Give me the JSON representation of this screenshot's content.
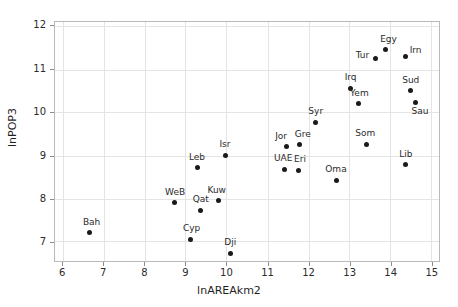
{
  "chart_data": {
    "type": "scatter",
    "title": "",
    "xlabel": "lnAREAkm2",
    "ylabel": "lnPOP3",
    "xlim": [
      5.8,
      15.2
    ],
    "ylim": [
      6.55,
      12.1
    ],
    "xticks": [
      6,
      7,
      8,
      9,
      10,
      11,
      12,
      13,
      14,
      15
    ],
    "yticks": [
      7,
      8,
      9,
      10,
      11,
      12
    ],
    "grid": true,
    "legend": "none",
    "marker_color": "#1a1a1a",
    "grid_color": "#e4e4e4",
    "frame_color": "#b9b9b9",
    "points": [
      {
        "label": "Bah",
        "x": 6.65,
        "y": 7.25,
        "lx": -7,
        "ly": -15
      },
      {
        "label": "WeB",
        "x": 8.7,
        "y": 7.94,
        "lx": -9,
        "ly": -15
      },
      {
        "label": "Cyp",
        "x": 9.11,
        "y": 7.1,
        "lx": -8,
        "ly": -15
      },
      {
        "label": "Qat",
        "x": 9.35,
        "y": 7.76,
        "lx": -8,
        "ly": -15
      },
      {
        "label": "Leb",
        "x": 9.28,
        "y": 8.74,
        "lx": -9,
        "ly": -15
      },
      {
        "label": "Kuw",
        "x": 9.78,
        "y": 7.98,
        "lx": -11,
        "ly": -15
      },
      {
        "label": "Isr",
        "x": 9.95,
        "y": 9.03,
        "lx": -6,
        "ly": -15
      },
      {
        "label": "Dji",
        "x": 10.07,
        "y": 6.78,
        "lx": -6,
        "ly": -15
      },
      {
        "label": "UAE",
        "x": 11.4,
        "y": 8.71,
        "lx": -11,
        "ly": -15
      },
      {
        "label": "Jor",
        "x": 11.43,
        "y": 9.23,
        "lx": -11,
        "ly": -15
      },
      {
        "label": "Eri",
        "x": 11.72,
        "y": 8.69,
        "lx": -4,
        "ly": -15
      },
      {
        "label": "Gre",
        "x": 11.76,
        "y": 9.27,
        "lx": -5,
        "ly": -15
      },
      {
        "label": "Syr",
        "x": 12.14,
        "y": 9.79,
        "lx": -7,
        "ly": -15
      },
      {
        "label": "Oma",
        "x": 12.65,
        "y": 8.45,
        "lx": -11,
        "ly": -15
      },
      {
        "label": "Irq",
        "x": 13.0,
        "y": 10.57,
        "lx": -6,
        "ly": -15
      },
      {
        "label": "Yem",
        "x": 13.18,
        "y": 10.22,
        "lx": -8,
        "ly": -15
      },
      {
        "label": "Som",
        "x": 13.38,
        "y": 9.29,
        "lx": -11,
        "ly": -15
      },
      {
        "label": "Tur",
        "x": 13.61,
        "y": 11.27,
        "lx": -20,
        "ly": -7
      },
      {
        "label": "Egy",
        "x": 13.84,
        "y": 11.46,
        "lx": -5,
        "ly": -15
      },
      {
        "label": "Lib",
        "x": 14.33,
        "y": 8.81,
        "lx": -6,
        "ly": -15
      },
      {
        "label": "Irn",
        "x": 14.34,
        "y": 11.3,
        "lx": 4,
        "ly": -11
      },
      {
        "label": "Sud",
        "x": 14.45,
        "y": 10.52,
        "lx": -8,
        "ly": -15
      },
      {
        "label": "Sau",
        "x": 14.58,
        "y": 10.24,
        "lx": -4,
        "ly": 4
      }
    ]
  }
}
